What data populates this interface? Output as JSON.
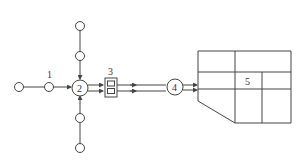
{
  "diagram": {
    "labels": {
      "n1": "1",
      "n2": "2",
      "n3": "3",
      "n4": "4",
      "n5": "5"
    },
    "colors": {
      "stroke": "#444444",
      "background": "#ffffff"
    }
  }
}
